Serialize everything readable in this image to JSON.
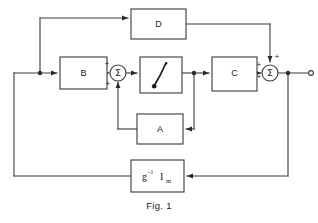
{
  "figure": {
    "caption": "Fig. 1",
    "blocks": [
      {
        "id": "D",
        "label": "D",
        "x": 131,
        "y": 9,
        "w": 55,
        "h": 30
      },
      {
        "id": "B",
        "label": "B",
        "x": 60,
        "y": 57,
        "w": 47,
        "h": 32
      },
      {
        "id": "INT",
        "label": "",
        "x": 140,
        "y": 57,
        "w": 42,
        "h": 36
      },
      {
        "id": "C",
        "label": "C",
        "x": 212,
        "y": 57,
        "w": 45,
        "h": 34
      },
      {
        "id": "A",
        "label": "A",
        "x": 137,
        "y": 114,
        "w": 46,
        "h": 30
      },
      {
        "id": "GAIN",
        "label": "g^-1 I_m",
        "x": 131,
        "y": 160,
        "w": 53,
        "h": 32
      }
    ],
    "gain_block": {
      "base": "g",
      "superscript": "-1",
      "symbol": "I",
      "subscript": "m"
    },
    "summing_junctions": [
      {
        "id": "sum-left",
        "glyph": "Σ",
        "cx": 118,
        "cy": 73,
        "r": 8,
        "signs": [
          {
            "text": "+",
            "x": 107,
            "y": 64
          },
          {
            "text": "+",
            "x": 108,
            "y": 84
          }
        ]
      },
      {
        "id": "sum-right",
        "glyph": "Σ",
        "cx": 270,
        "cy": 73,
        "r": 8,
        "signs": [
          {
            "text": "+",
            "x": 277,
            "y": 57
          },
          {
            "text": "+",
            "x": 259,
            "y": 65
          },
          {
            "text": "+",
            "x": 259,
            "y": 77
          }
        ]
      }
    ],
    "output_terminal": {
      "cx": 311,
      "cy": 73,
      "r": 2.4
    },
    "junction_dots": [
      {
        "x": 40,
        "y": 73
      },
      {
        "x": 194,
        "y": 73
      },
      {
        "x": 288,
        "y": 73
      }
    ],
    "colors": {
      "line": "#3a3a3a",
      "text": "#1a1a1a",
      "background": "#ffffff"
    },
    "integrator_symbol": "integral-saturation-curve"
  }
}
